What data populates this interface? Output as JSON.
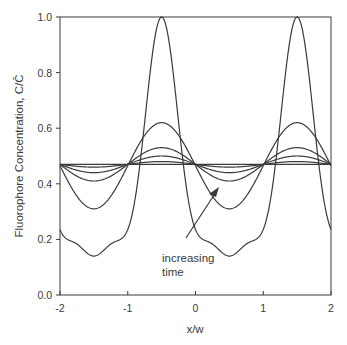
{
  "chart_data": {
    "type": "line",
    "title": "",
    "xlabel": "x/w",
    "ylabel": "Fluorophore Concentration, C/C̄",
    "xlim": [
      -2,
      2
    ],
    "ylim": [
      0.0,
      1.0
    ],
    "xticks": [
      -2,
      -1,
      0,
      1,
      2
    ],
    "xtick_labels": [
      "-2",
      "-1",
      "0",
      "1",
      "2"
    ],
    "yticks": [
      0.0,
      0.2,
      0.4,
      0.6,
      0.8,
      1.0
    ],
    "ytick_labels": [
      "0.0",
      "0.2",
      "0.4",
      "0.6",
      "0.8",
      "1.0"
    ],
    "grid": false,
    "legend": null,
    "annotation": {
      "text_line1": "increasing",
      "text_line2": "time",
      "arrow_from": [
        -0.35,
        0.2
      ],
      "arrow_to": [
        0.1,
        0.38
      ]
    },
    "baseline": 0.47,
    "period": 2,
    "peak_positions": [
      -0.5,
      1.5
    ],
    "trough_positions": [
      -1.5,
      0.5
    ],
    "series": [
      {
        "name": "t0",
        "peak": 1.0,
        "trough": 0.14
      },
      {
        "name": "t1",
        "peak": 0.62,
        "trough": 0.31
      },
      {
        "name": "t2",
        "peak": 0.53,
        "trough": 0.41
      },
      {
        "name": "t3",
        "peak": 0.5,
        "trough": 0.44
      },
      {
        "name": "t4",
        "peak": 0.48,
        "trough": 0.46
      },
      {
        "name": "t5",
        "peak": 0.47,
        "trough": 0.47
      }
    ]
  }
}
